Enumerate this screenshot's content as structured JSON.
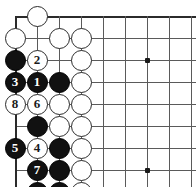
{
  "diagram": {
    "kind": "go-board-problem-diagram",
    "board": {
      "origin_x": 15,
      "origin_y": 16,
      "spacing": 22,
      "cols": 9,
      "rows": 8,
      "edges": {
        "top": true,
        "left": true,
        "right": false,
        "bottom": false
      },
      "line_color": "#5a5a5a",
      "edge_color": "#2b2b2b"
    },
    "hoshi": [
      {
        "col": 6,
        "row": 2
      },
      {
        "col": 6,
        "row": 7
      }
    ],
    "stones": [
      {
        "col": 1,
        "row": 0,
        "color": "white",
        "label": ""
      },
      {
        "col": 0,
        "row": 1,
        "color": "white",
        "label": ""
      },
      {
        "col": 2,
        "row": 1,
        "color": "white",
        "label": ""
      },
      {
        "col": 3,
        "row": 1,
        "color": "white",
        "label": ""
      },
      {
        "col": 0,
        "row": 2,
        "color": "black",
        "label": ""
      },
      {
        "col": 1,
        "row": 2,
        "color": "white",
        "label": "2"
      },
      {
        "col": 3,
        "row": 2,
        "color": "white",
        "label": ""
      },
      {
        "col": 0,
        "row": 3,
        "color": "black",
        "label": "3"
      },
      {
        "col": 1,
        "row": 3,
        "color": "black",
        "label": "1"
      },
      {
        "col": 2,
        "row": 3,
        "color": "black",
        "label": ""
      },
      {
        "col": 3,
        "row": 3,
        "color": "white",
        "label": ""
      },
      {
        "col": 0,
        "row": 4,
        "color": "white",
        "label": "8"
      },
      {
        "col": 1,
        "row": 4,
        "color": "white",
        "label": "6"
      },
      {
        "col": 2,
        "row": 4,
        "color": "white",
        "label": ""
      },
      {
        "col": 3,
        "row": 4,
        "color": "white",
        "label": ""
      },
      {
        "col": 1,
        "row": 5,
        "color": "black",
        "label": ""
      },
      {
        "col": 2,
        "row": 5,
        "color": "white",
        "label": ""
      },
      {
        "col": 3,
        "row": 5,
        "color": "white",
        "label": ""
      },
      {
        "col": 0,
        "row": 6,
        "color": "black",
        "label": "5"
      },
      {
        "col": 1,
        "row": 6,
        "color": "white",
        "label": "4"
      },
      {
        "col": 2,
        "row": 6,
        "color": "black",
        "label": ""
      },
      {
        "col": 3,
        "row": 6,
        "color": "white",
        "label": ""
      },
      {
        "col": 1,
        "row": 7,
        "color": "black",
        "label": "7"
      },
      {
        "col": 2,
        "row": 7,
        "color": "black",
        "label": ""
      },
      {
        "col": 3,
        "row": 7,
        "color": "white",
        "label": ""
      },
      {
        "col": 1,
        "row": 8,
        "color": "black",
        "label": ""
      },
      {
        "col": 2,
        "row": 8,
        "color": "black",
        "label": ""
      },
      {
        "col": 3,
        "row": 8,
        "color": "white",
        "label": ""
      },
      {
        "col": 0,
        "row": 9,
        "color": "black",
        "label": "9"
      },
      {
        "col": 3,
        "row": 9,
        "color": "white",
        "label": ""
      },
      {
        "col": 1,
        "row": 10,
        "color": "white",
        "label": ""
      },
      {
        "col": 2,
        "row": 10,
        "color": "white",
        "label": ""
      }
    ]
  }
}
